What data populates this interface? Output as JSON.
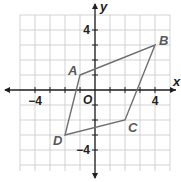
{
  "diagram": {
    "type": "coordinate-plane-quadrilateral",
    "axes": {
      "x_label": "x",
      "y_label": "y",
      "origin_label": "O",
      "x_range": [
        -5,
        5
      ],
      "y_range": [
        -5,
        5
      ],
      "tick_step": 1,
      "labeled_ticks": {
        "x": [
          {
            "value": -4,
            "label": "−4"
          },
          {
            "value": 4,
            "label": "4"
          }
        ],
        "y": [
          {
            "value": 4,
            "label": "4"
          },
          {
            "value": -4,
            "label": "−4"
          }
        ]
      }
    },
    "vertices": [
      {
        "name": "A",
        "x": -1,
        "y": 1
      },
      {
        "name": "B",
        "x": 4,
        "y": 3
      },
      {
        "name": "C",
        "x": 2,
        "y": -2
      },
      {
        "name": "D",
        "x": -2,
        "y": -3
      }
    ],
    "polygon_order": [
      "A",
      "B",
      "C",
      "D"
    ],
    "colors": {
      "grid": "#c8c8c8",
      "axis": "#231f20",
      "polygon": "#6d6e71",
      "vertex_label": "#58595b"
    }
  }
}
